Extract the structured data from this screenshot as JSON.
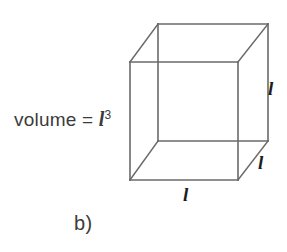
{
  "figure": {
    "caption": "b)",
    "formula": {
      "prefix": "volume = ",
      "variable": "l",
      "exponent": "3"
    },
    "edge_labels": {
      "right": "l",
      "bottom": "l",
      "depth": "l"
    },
    "shape": {
      "name": "cube-wireframe",
      "line_color": "#6a6a6a",
      "background": "#ffffff",
      "front_face": {
        "left": 130,
        "top": 62,
        "right": 238,
        "bottom": 180
      },
      "back_face": {
        "left": 158,
        "top": 24,
        "right": 268,
        "bottom": 141
      }
    }
  }
}
